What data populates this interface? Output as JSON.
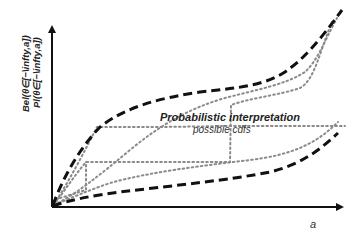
{
  "figure": {
    "y_axis_label": {
      "line1": "Bel(θ∈[−\\infty,a])",
      "line2": "Pl(θ∈[−\\infty,a])"
    },
    "x_axis_label": "a",
    "annotation": {
      "title": "Probabilistic interpretation",
      "subtitle": "possible cdfs"
    },
    "colors": {
      "axis": "#111111",
      "bound_dashed": "#111111",
      "cdf_dotted": "#8a8a8a",
      "text": "#222222"
    },
    "legend": {
      "dashed": "Belief / Plausibility bounds",
      "dotted": "possible cdfs"
    }
  }
}
